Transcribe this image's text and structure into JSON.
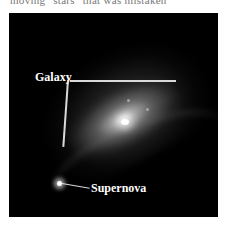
{
  "caption_fragment": "moving \"stars\" that was mistaken",
  "figure": {
    "background_color": "#000000",
    "labels": {
      "galaxy": "Galaxy",
      "supernova": "Supernova"
    },
    "leader_line_color": "#d9d9d9"
  }
}
